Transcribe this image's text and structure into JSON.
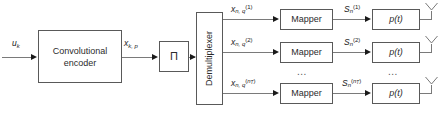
{
  "diagram": {
    "width": 443,
    "height": 115,
    "colors": {
      "background": "#ffffff",
      "block_border": "#595959",
      "wire": "#7a7a7a",
      "arrow": "#1a1a1a",
      "text": "#2b2b2b"
    }
  },
  "blocks": {
    "encoder": {
      "line1": "Convolutional",
      "line2": "encoder"
    },
    "interleaver": {
      "label": "Π"
    },
    "demultiplexer": {
      "label": "Demultiplexer"
    },
    "mappers": [
      {
        "label": "Mapper"
      },
      {
        "label": "Mapper"
      },
      {
        "label": "Mapper"
      }
    ],
    "pulse_shapers": [
      {
        "label": "p(t)"
      },
      {
        "label": "p(t)"
      },
      {
        "label": "p(t)"
      }
    ]
  },
  "signals": {
    "input": {
      "base": "u",
      "sub": "k"
    },
    "encoder_output": {
      "base": "x",
      "sub": "k, p"
    },
    "demux_outputs": [
      {
        "base": "x",
        "sub": "n, q",
        "sup": "(1)"
      },
      {
        "base": "x",
        "sub": "n, q",
        "sup": "(2)"
      },
      {
        "base": "x",
        "sub": "n, q",
        "sup": "(n_T)",
        "sup_base": "n",
        "sup_sub": "T"
      }
    ],
    "mapper_outputs": [
      {
        "base": "S",
        "sub": "n",
        "sup": "(1)"
      },
      {
        "base": "S",
        "sub": "n",
        "sup": "(2)"
      },
      {
        "base": "S",
        "sub": "n",
        "sup": "(n_T)",
        "sup_base": "n",
        "sup_sub": "T"
      }
    ]
  },
  "ellipses": {
    "mapper_column": "...",
    "pulse_column": "..."
  },
  "icons": {
    "antennas": [
      "antenna-icon",
      "antenna-icon",
      "antenna-icon"
    ]
  }
}
